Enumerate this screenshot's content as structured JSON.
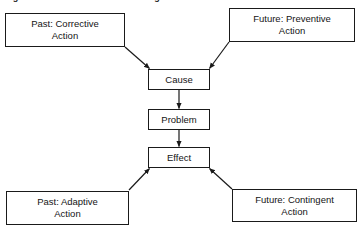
{
  "figure": {
    "caption": "Figure 3-1.  Cause and Effect Diagram",
    "background_color": "#ffffff",
    "line_color": "#1a1a1a",
    "text_color": "#141414"
  },
  "boxes": {
    "past_corrective": {
      "line1": "Past:  Corrective",
      "line2": "Action"
    },
    "future_preventive": {
      "line1": "Future:  Preventive",
      "line2": "Action"
    },
    "past_adaptive": {
      "line1": "Past:  Adaptive",
      "line2": "Action"
    },
    "future_contingent": {
      "line1": "Future:  Contingent",
      "line2": "Action"
    },
    "cause": {
      "label": "Cause"
    },
    "problem": {
      "label": "Problem"
    },
    "effect": {
      "label": "Effect"
    }
  },
  "connectors": [
    {
      "name": "past-corrective-to-cause",
      "from": "past_corrective",
      "to": "cause",
      "style": "diagonal",
      "arrowhead": "at-target"
    },
    {
      "name": "future-preventive-to-cause",
      "from": "future_preventive",
      "to": "cause",
      "style": "diagonal",
      "arrowhead": "at-target"
    },
    {
      "name": "cause-to-problem",
      "from": "cause",
      "to": "problem",
      "style": "vertical",
      "arrowhead": "at-target"
    },
    {
      "name": "problem-to-effect",
      "from": "problem",
      "to": "effect",
      "style": "vertical",
      "arrowhead": "at-target"
    },
    {
      "name": "past-adaptive-to-effect",
      "from": "past_adaptive",
      "to": "effect",
      "style": "diagonal",
      "arrowhead": "at-target"
    },
    {
      "name": "future-contingent-to-effect",
      "from": "future_contingent",
      "to": "effect",
      "style": "diagonal",
      "arrowhead": "at-target"
    }
  ]
}
